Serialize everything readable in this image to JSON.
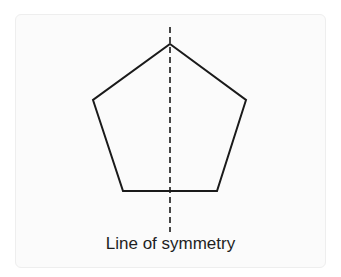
{
  "diagram": {
    "shape": "regular pentagon",
    "caption": "Line of symmetry",
    "stroke_color": "#1a1a1a",
    "line_style": "dashed"
  }
}
